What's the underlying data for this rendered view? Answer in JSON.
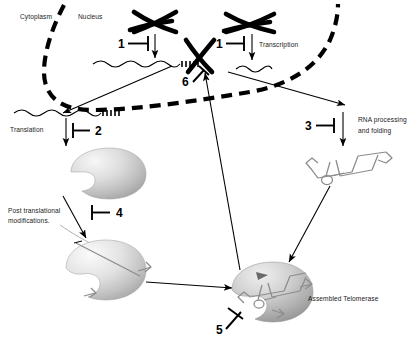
{
  "figure": {
    "background_color": "#ffffff",
    "line_color": "#000000",
    "protein_color": "#bdbdbd",
    "rna_color": "#8c8c8c"
  },
  "compartments": [
    {
      "id": "cytoplasm",
      "label": "Cytoplasm",
      "x": 20,
      "y": 17
    },
    {
      "id": "nucleus",
      "label": "Nucleus",
      "x": 78,
      "y": 17
    }
  ],
  "process_labels": [
    {
      "id": "transcription",
      "label": "Transcription",
      "x": 259,
      "y": 47
    },
    {
      "id": "translation",
      "label": "Translation",
      "x": 10,
      "y": 132
    },
    {
      "id": "rna-processing",
      "label": "RNA processing",
      "x": 358,
      "y": 120
    },
    {
      "id": "rna-folding",
      "label": "and folding",
      "x": 358,
      "y": 131
    },
    {
      "id": "post-translational-1",
      "label": "Post translational",
      "x": 8,
      "y": 210
    },
    {
      "id": "post-translational-2",
      "label": "modifications.",
      "x": 8,
      "y": 221
    },
    {
      "id": "assembled-telomerase",
      "label": "Assembled Telomerase",
      "x": 308,
      "y": 299
    }
  ],
  "inhibitors": [
    {
      "id": "inhibitor-1-left",
      "number": "1",
      "x": 118,
      "y": 48,
      "target": "translation-of-TERT-gene"
    },
    {
      "id": "inhibitor-1-right",
      "number": "1",
      "x": 216,
      "y": 48,
      "target": "transcription"
    },
    {
      "id": "inhibitor-2",
      "number": "2",
      "x": 95,
      "y": 131,
      "target": "translation"
    },
    {
      "id": "inhibitor-3",
      "number": "3",
      "x": 305,
      "y": 126,
      "target": "rna-processing-and-folding"
    },
    {
      "id": "inhibitor-4",
      "number": "4",
      "x": 116,
      "y": 213,
      "target": "post-translational-modifications"
    },
    {
      "id": "inhibitor-5",
      "number": "5",
      "x": 216,
      "y": 330,
      "target": "assembled-telomerase-activity"
    },
    {
      "id": "inhibitor-6",
      "number": "6",
      "x": 182,
      "y": 82,
      "target": "telomere-elongation"
    }
  ],
  "entities": [
    {
      "id": "chromosome-left",
      "kind": "chromosome",
      "label": ""
    },
    {
      "id": "chromosome-right",
      "kind": "chromosome",
      "label": ""
    },
    {
      "id": "telomere-chromosome",
      "kind": "chromosome-with-telomere",
      "label": ""
    },
    {
      "id": "mrna-left",
      "kind": "mrna-polyA",
      "label": ""
    },
    {
      "id": "mrna-cytoplasm",
      "kind": "mrna-polyA",
      "label": ""
    },
    {
      "id": "ncrna-right",
      "kind": "rna-transcript",
      "label": ""
    },
    {
      "id": "rna-cloverleaf",
      "kind": "folded-rna",
      "label": ""
    },
    {
      "id": "protein-nascent",
      "kind": "protein",
      "label": ""
    },
    {
      "id": "protein-modified",
      "kind": "modified-protein",
      "label": ""
    },
    {
      "id": "telomerase-complex",
      "kind": "ribonucleoprotein-complex",
      "label": ""
    }
  ]
}
